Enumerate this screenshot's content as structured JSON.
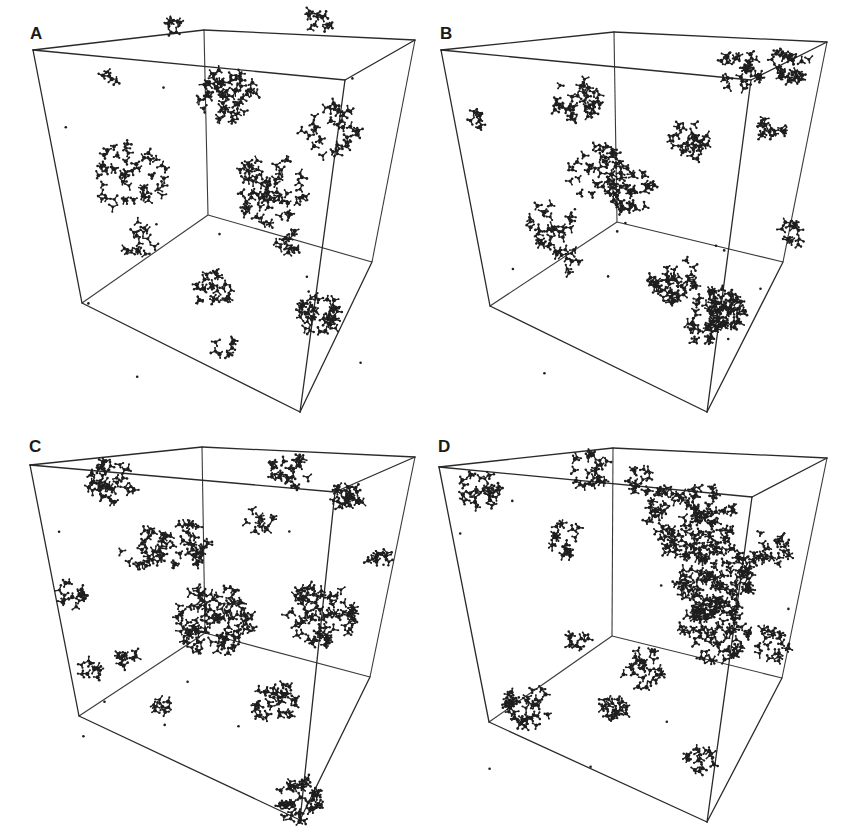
{
  "figure": {
    "background": "#ffffff",
    "line_color": "#2a2a2a",
    "molecule_color": "#1e1e1e"
  },
  "panels": [
    {
      "label": "A",
      "cube": {
        "front": [
          [
            33,
            50
          ],
          [
            415,
            40
          ],
          [
            345,
            80
          ],
          [
            320,
            80
          ]
        ],
        "frontTL": [
          33,
          50
        ],
        "frontTR": [
          345,
          80
        ],
        "frontBR": [
          300,
          412
        ],
        "frontBL": [
          82,
          303
        ],
        "backTL": [
          204,
          30
        ],
        "backTR": [
          415,
          40
        ],
        "backBR": [
          372,
          262
        ],
        "backBL": [
          208,
          215
        ]
      },
      "clusters": [
        {
          "x": 228,
          "y": 95,
          "r": 30,
          "n": 60
        },
        {
          "x": 270,
          "y": 190,
          "r": 38,
          "n": 70
        },
        {
          "x": 130,
          "y": 175,
          "r": 40,
          "n": 50
        },
        {
          "x": 330,
          "y": 130,
          "r": 30,
          "n": 35
        },
        {
          "x": 215,
          "y": 290,
          "r": 20,
          "n": 25
        },
        {
          "x": 320,
          "y": 315,
          "r": 22,
          "n": 40
        },
        {
          "x": 175,
          "y": 25,
          "r": 10,
          "n": 8
        },
        {
          "x": 320,
          "y": 20,
          "r": 15,
          "n": 12
        },
        {
          "x": 110,
          "y": 80,
          "r": 10,
          "n": 5
        },
        {
          "x": 140,
          "y": 240,
          "r": 20,
          "n": 15
        },
        {
          "x": 225,
          "y": 345,
          "r": 12,
          "n": 8
        },
        {
          "x": 290,
          "y": 240,
          "r": 15,
          "n": 12
        }
      ]
    },
    {
      "label": "B",
      "cube": {
        "frontTL": [
          441,
          50
        ],
        "frontTR": [
          751,
          80
        ],
        "frontBR": [
          707,
          412
        ],
        "frontBL": [
          490,
          306
        ],
        "backTL": [
          614,
          32
        ],
        "backTR": [
          827,
          42
        ],
        "backBR": [
          783,
          262
        ],
        "backBL": [
          617,
          222
        ]
      },
      "clusters": [
        {
          "x": 577,
          "y": 100,
          "r": 25,
          "n": 35
        },
        {
          "x": 720,
          "y": 310,
          "r": 25,
          "n": 70
        },
        {
          "x": 740,
          "y": 70,
          "r": 22,
          "n": 30
        },
        {
          "x": 790,
          "y": 65,
          "r": 20,
          "n": 30
        },
        {
          "x": 690,
          "y": 140,
          "r": 22,
          "n": 30
        },
        {
          "x": 630,
          "y": 190,
          "r": 25,
          "n": 40
        },
        {
          "x": 595,
          "y": 170,
          "r": 30,
          "n": 40
        },
        {
          "x": 550,
          "y": 225,
          "r": 25,
          "n": 30
        },
        {
          "x": 675,
          "y": 280,
          "r": 25,
          "n": 45
        },
        {
          "x": 565,
          "y": 260,
          "r": 15,
          "n": 12
        },
        {
          "x": 475,
          "y": 120,
          "r": 10,
          "n": 8
        },
        {
          "x": 700,
          "y": 330,
          "r": 15,
          "n": 15
        },
        {
          "x": 770,
          "y": 130,
          "r": 15,
          "n": 15
        },
        {
          "x": 790,
          "y": 235,
          "r": 15,
          "n": 12
        }
      ]
    },
    {
      "label": "C",
      "cube": {
        "frontTL": [
          30,
          465
        ],
        "frontTR": [
          335,
          492
        ],
        "frontBR": [
          300,
          820
        ],
        "frontBL": [
          79,
          716
        ],
        "backTL": [
          202,
          447
        ],
        "backTR": [
          415,
          457
        ],
        "backBR": [
          370,
          677
        ],
        "backBL": [
          205,
          633
        ]
      },
      "clusters": [
        {
          "x": 112,
          "y": 480,
          "r": 25,
          "n": 40
        },
        {
          "x": 215,
          "y": 620,
          "r": 40,
          "n": 100
        },
        {
          "x": 320,
          "y": 615,
          "r": 35,
          "n": 80
        },
        {
          "x": 290,
          "y": 470,
          "r": 20,
          "n": 25
        },
        {
          "x": 350,
          "y": 497,
          "r": 18,
          "n": 25
        },
        {
          "x": 145,
          "y": 545,
          "r": 25,
          "n": 30
        },
        {
          "x": 185,
          "y": 545,
          "r": 25,
          "n": 35
        },
        {
          "x": 72,
          "y": 595,
          "r": 15,
          "n": 15
        },
        {
          "x": 300,
          "y": 800,
          "r": 25,
          "n": 45
        },
        {
          "x": 275,
          "y": 700,
          "r": 25,
          "n": 35
        },
        {
          "x": 90,
          "y": 670,
          "r": 12,
          "n": 10
        },
        {
          "x": 125,
          "y": 655,
          "r": 12,
          "n": 10
        },
        {
          "x": 160,
          "y": 705,
          "r": 12,
          "n": 8
        },
        {
          "x": 380,
          "y": 560,
          "r": 12,
          "n": 12
        },
        {
          "x": 260,
          "y": 520,
          "r": 15,
          "n": 12
        }
      ]
    },
    {
      "label": "D",
      "cube": {
        "frontTL": [
          439,
          467
        ],
        "frontTR": [
          752,
          497
        ],
        "frontBR": [
          707,
          822
        ],
        "frontBL": [
          489,
          722
        ],
        "backTL": [
          613,
          448
        ],
        "backTR": [
          827,
          458
        ],
        "backBR": [
          782,
          678
        ],
        "backBL": [
          612,
          636
        ]
      },
      "clusters": [
        {
          "x": 690,
          "y": 520,
          "r": 45,
          "n": 130
        },
        {
          "x": 715,
          "y": 580,
          "r": 40,
          "n": 120
        },
        {
          "x": 715,
          "y": 630,
          "r": 35,
          "n": 80
        },
        {
          "x": 480,
          "y": 490,
          "r": 22,
          "n": 30
        },
        {
          "x": 590,
          "y": 470,
          "r": 20,
          "n": 25
        },
        {
          "x": 640,
          "y": 480,
          "r": 15,
          "n": 15
        },
        {
          "x": 565,
          "y": 540,
          "r": 20,
          "n": 20
        },
        {
          "x": 770,
          "y": 550,
          "r": 22,
          "n": 25
        },
        {
          "x": 770,
          "y": 645,
          "r": 20,
          "n": 20
        },
        {
          "x": 530,
          "y": 705,
          "r": 25,
          "n": 40
        },
        {
          "x": 614,
          "y": 710,
          "r": 15,
          "n": 20
        },
        {
          "x": 700,
          "y": 760,
          "r": 15,
          "n": 15
        },
        {
          "x": 580,
          "y": 640,
          "r": 12,
          "n": 10
        },
        {
          "x": 642,
          "y": 668,
          "r": 22,
          "n": 25
        }
      ]
    }
  ]
}
